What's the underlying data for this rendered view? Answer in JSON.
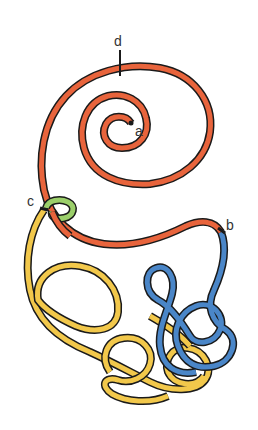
{
  "diagram": {
    "labels": {
      "a": "a",
      "b": "b",
      "c": "c",
      "d": "d"
    },
    "colors": {
      "red_segment": "#e8643c",
      "yellow_segment": "#f2c84b",
      "blue_segment": "#4a86c8",
      "green_ring": "#9bcf6a",
      "outline": "#1a1a1a",
      "background": "#ffffff"
    },
    "segments": [
      {
        "name": "red spiral",
        "from": "a",
        "to": "b",
        "marker": "d"
      },
      {
        "name": "yellow loops",
        "from": "c",
        "to": "tangle"
      },
      {
        "name": "blue loops",
        "from": "b",
        "to": "tangle"
      },
      {
        "name": "green ring",
        "at": "c"
      }
    ]
  }
}
